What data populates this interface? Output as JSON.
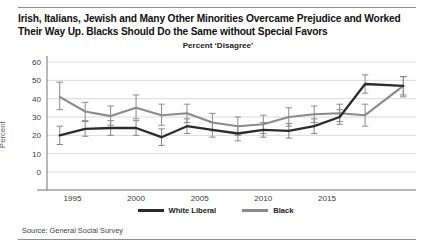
{
  "title": "Irish, Italians, Jewish and Many Other Minorities Overcame Prejudice and Worked Their Way Up. Blacks Should Do the Same without Special Favors",
  "subtitle": "Percent ‘Disagree’",
  "source": "Source: General Social Survey",
  "colors": {
    "white_liberal": "#2b2b2b",
    "black_series": "#8a8a8a",
    "gridline": "#d9d9d9",
    "axis": "#8a8a8a",
    "errorbar": "#8a8a8a"
  },
  "legend": {
    "position": "bottom-center",
    "items": [
      {
        "label": "White Liberal",
        "color": "#2b2b2b"
      },
      {
        "label": "Black",
        "color": "#8a8a8a"
      }
    ]
  },
  "chart_data": {
    "type": "line",
    "title": "Irish, Italians, Jewish and Many Other Minorities Overcame Prejudice and Worked Their Way Up. Blacks Should Do the Same without Special Favors",
    "subtitle": "Percent ‘Disagree’",
    "xlabel": "",
    "ylabel": "Percent",
    "ylim": [
      0,
      60
    ],
    "yticks": [
      0,
      10,
      20,
      30,
      40,
      50,
      60
    ],
    "xlim": [
      1993,
      2022
    ],
    "xticks": [
      1995,
      2000,
      2005,
      2010,
      2015
    ],
    "grid": true,
    "x": [
      1994,
      1996,
      1998,
      2000,
      2002,
      2004,
      2006,
      2008,
      2010,
      2012,
      2014,
      2016,
      2018,
      2021
    ],
    "series": [
      {
        "name": "White Liberal",
        "color": "#2b2b2b",
        "values": [
          20,
          23.5,
          24,
          24,
          19,
          25,
          23,
          21,
          23,
          22.5,
          25,
          30,
          48,
          47
        ],
        "err_low": [
          15,
          19.5,
          20,
          20,
          14.5,
          21,
          19,
          17,
          19,
          18.5,
          21,
          26,
          43,
          42
        ],
        "err_high": [
          25,
          27.5,
          28,
          28,
          23.5,
          29,
          27,
          25,
          27,
          26.5,
          29,
          34,
          53,
          52
        ]
      },
      {
        "name": "Black",
        "color": "#8a8a8a",
        "values": [
          41,
          33,
          30.5,
          35,
          31,
          32,
          27,
          25,
          26,
          30,
          31.5,
          32,
          31,
          47
        ],
        "err_low": [
          34,
          28,
          25.5,
          29,
          25.5,
          27,
          22.5,
          20,
          21,
          25,
          27,
          27.5,
          25,
          41
        ],
        "err_high": [
          49,
          38,
          36,
          42,
          37,
          37,
          32,
          30,
          31,
          35,
          36,
          37,
          37,
          52
        ]
      }
    ]
  }
}
